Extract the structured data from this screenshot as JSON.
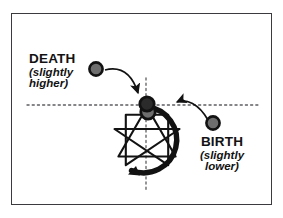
{
  "figure": {
    "background_color": "#ffffff",
    "frame_color": "#3b3b3f",
    "ink_color": "#121212",
    "marker_fill": "#6e6e6e",
    "marker_stroke": "#121212"
  },
  "labels": {
    "death": {
      "heading": "DEATH",
      "subtitle_line1": "(slightly",
      "subtitle_line2": "higher)"
    },
    "birth": {
      "heading": "BIRTH",
      "subtitle_line1": "(slightly",
      "subtitle_line2": "lower)"
    }
  },
  "diagram": {
    "enneagram": {
      "center_x": 147,
      "center_y": 140,
      "radius": 33,
      "point_count": 9,
      "rotation_direction": "counter-clockwise",
      "inner_triangle_points": [
        9,
        3,
        6
      ],
      "hexad_sequence": [
        1,
        4,
        2,
        8,
        5,
        7
      ]
    },
    "axes": {
      "horizontal_dotted_y": 105,
      "horizontal_dotted_x_start": 27,
      "horizontal_dotted_x_end": 258,
      "vertical_dotted_x": 146,
      "vertical_dotted_y_start": 78,
      "vertical_dotted_y_end": 190
    },
    "markers": [
      {
        "name": "death-marker-source",
        "x": 96,
        "y": 69,
        "radius": 7
      },
      {
        "name": "birth-marker-source",
        "x": 213,
        "y": 123,
        "radius": 7
      },
      {
        "name": "death-point-on-circle",
        "x": 147,
        "y": 104,
        "radius": 7.5
      },
      {
        "name": "birth-point-on-circle",
        "x": 148,
        "y": 112,
        "radius": 7.5
      }
    ]
  }
}
